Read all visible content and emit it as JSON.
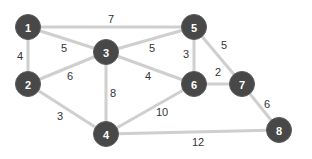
{
  "graph": {
    "colors": {
      "node_fill": "#484848",
      "node_text": "#ffffff",
      "edge": "#cfcfcf",
      "weight_text": "#333333"
    },
    "nodes": [
      {
        "id": "1",
        "x": 28,
        "y": 27
      },
      {
        "id": "2",
        "x": 28,
        "y": 84
      },
      {
        "id": "3",
        "x": 106,
        "y": 52
      },
      {
        "id": "4",
        "x": 106,
        "y": 134
      },
      {
        "id": "5",
        "x": 194,
        "y": 27
      },
      {
        "id": "6",
        "x": 194,
        "y": 84
      },
      {
        "id": "7",
        "x": 242,
        "y": 84
      },
      {
        "id": "8",
        "x": 279,
        "y": 130
      }
    ],
    "edges": [
      {
        "from": "1",
        "to": "5",
        "weight": "7",
        "lx": 111,
        "ly": 19
      },
      {
        "from": "1",
        "to": "2",
        "weight": "4",
        "lx": 20,
        "ly": 56
      },
      {
        "from": "1",
        "to": "3",
        "weight": "5",
        "lx": 64,
        "ly": 48
      },
      {
        "from": "2",
        "to": "3",
        "weight": "6",
        "lx": 70,
        "ly": 76
      },
      {
        "from": "3",
        "to": "5",
        "weight": "5",
        "lx": 152,
        "ly": 48
      },
      {
        "from": "3",
        "to": "6",
        "weight": "4",
        "lx": 148,
        "ly": 76
      },
      {
        "from": "3",
        "to": "4",
        "weight": "8",
        "lx": 113,
        "ly": 93
      },
      {
        "from": "5",
        "to": "6",
        "weight": "3",
        "lx": 186,
        "ly": 54
      },
      {
        "from": "5",
        "to": "7",
        "weight": "5",
        "lx": 224,
        "ly": 45
      },
      {
        "from": "6",
        "to": "7",
        "weight": "2",
        "lx": 218,
        "ly": 72
      },
      {
        "from": "2",
        "to": "4",
        "weight": "3",
        "lx": 60,
        "ly": 116
      },
      {
        "from": "4",
        "to": "6",
        "weight": "10",
        "lx": 162,
        "ly": 112
      },
      {
        "from": "7",
        "to": "8",
        "weight": "6",
        "lx": 267,
        "ly": 104
      },
      {
        "from": "4",
        "to": "8",
        "weight": "12",
        "lx": 198,
        "ly": 142
      }
    ]
  }
}
